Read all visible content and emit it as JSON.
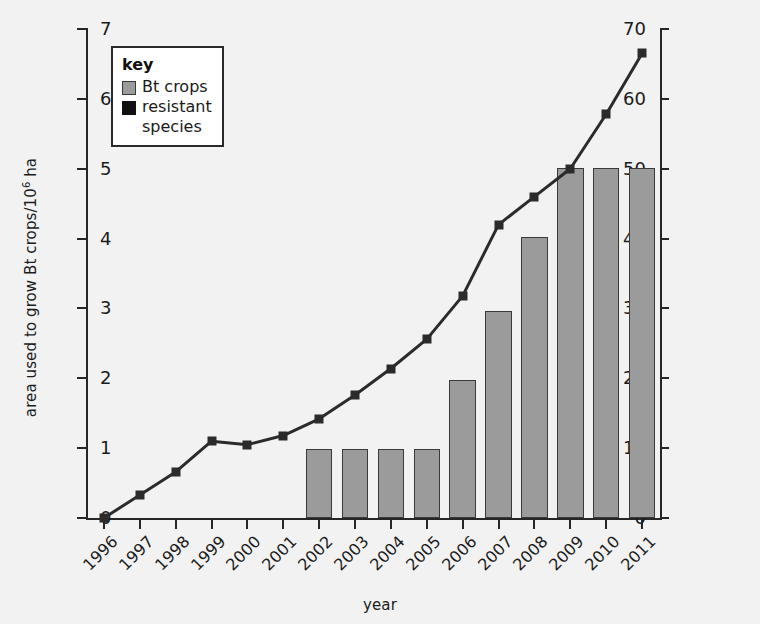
{
  "chart_data": {
    "type": "bar",
    "title": "",
    "xlabel": "year",
    "ylabel": "area used to grow Bt crops/10⁶ ha",
    "ylabel_right": "number of species of insect pest resistant to Bt toxin",
    "categories": [
      "1996",
      "1997",
      "1998",
      "1999",
      "2000",
      "2001",
      "2002",
      "2003",
      "2004",
      "2005",
      "2006",
      "2007",
      "2008",
      "2009",
      "2010",
      "2011"
    ],
    "ylim": [
      0,
      70
    ],
    "yticks": [
      0,
      10,
      20,
      30,
      40,
      50,
      60,
      70
    ],
    "ylim_right": [
      0,
      7
    ],
    "yticks_right": [
      0,
      1,
      2,
      3,
      4,
      5,
      6,
      7
    ],
    "grid": false,
    "legend_position": "upper-left inside",
    "series": [
      {
        "name": "Bt crops",
        "type": "bar",
        "axis": "left",
        "unit": "10^6 ha",
        "color": "#9b9b9b",
        "edge_color": "#3a3a3a",
        "values": [
          null,
          null,
          null,
          null,
          null,
          null,
          9.9,
          9.9,
          9.9,
          9.9,
          19.8,
          29.7,
          40.2,
          50.1,
          50.1,
          50.1
        ]
      },
      {
        "name": "resistant species",
        "type": "line",
        "axis": "right",
        "unit": "species",
        "color": "#2b2b2b",
        "marker": "square",
        "values": [
          0,
          0.33,
          0.66,
          1.1,
          1.05,
          1.18,
          1.42,
          1.76,
          2.14,
          2.56,
          3.18,
          4.2,
          4.6,
          5.0,
          5.78,
          6.65
        ]
      }
    ]
  },
  "axes": {
    "left": {
      "title": "area used to grow Bt crops/10",
      "title_sup": "6",
      "title_tail": " ha",
      "ticks": [
        "70",
        "60",
        "50",
        "40",
        "30",
        "20",
        "10",
        "0"
      ]
    },
    "right": {
      "title": "number of species of insect pest resistant to Bt toxin",
      "ticks": [
        "7",
        "6",
        "5",
        "4",
        "3",
        "2",
        "1",
        "0"
      ]
    },
    "bottom": {
      "title": "year",
      "ticks": [
        "1996",
        "1997",
        "1998",
        "1999",
        "2000",
        "2001",
        "2002",
        "2003",
        "2004",
        "2005",
        "2006",
        "2007",
        "2008",
        "2009",
        "2010",
        "2011"
      ]
    }
  },
  "legend": {
    "title": "key",
    "items": [
      {
        "label": "Bt crops",
        "label_line2": "",
        "swatch": "gray-square-swatch"
      },
      {
        "label": "resistant",
        "label_line2": "species",
        "swatch": "black-square-swatch"
      }
    ]
  }
}
